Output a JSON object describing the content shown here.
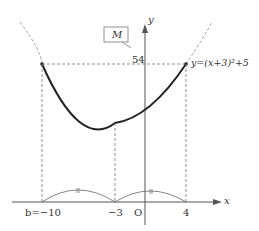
{
  "diagram": {
    "function_label": "y=(x+3)²+5",
    "max_label": "M",
    "y_value_label": "54",
    "axis_x_label": "x",
    "axis_y_label": "y",
    "origin_label": "O",
    "x_ticks": {
      "left": "b=−10",
      "vertex": "−3",
      "right": "4"
    },
    "equal_mark": "〃",
    "colors": {
      "curve": "#222222",
      "dashed": "#777777",
      "axis": "#555555"
    }
  }
}
